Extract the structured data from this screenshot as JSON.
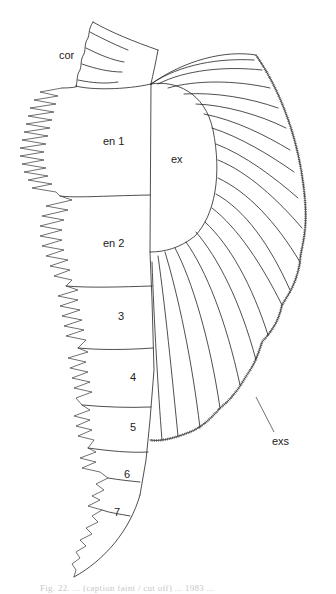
{
  "figure": {
    "type": "biological line drawing",
    "labels": {
      "coxa": "cor",
      "endopod_1": "en 1",
      "endopod_2": "en 2",
      "segment_3": "3",
      "segment_4": "4",
      "segment_5": "5",
      "segment_6": "6",
      "segment_7": "7",
      "exopod": "ex",
      "exopod_setae": "exs"
    },
    "caption": "Fig. 22. ... (caption faint / cut off) ... 1983 ..."
  }
}
